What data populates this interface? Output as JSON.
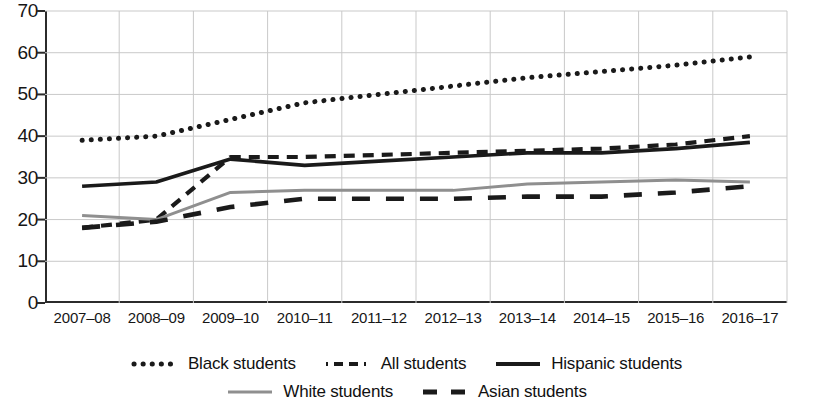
{
  "chart_data": {
    "type": "line",
    "title": "",
    "subtitle": "",
    "xlabel": "",
    "ylabel": "",
    "ylim": [
      0,
      70
    ],
    "yticks": [
      0,
      10,
      20,
      30,
      40,
      50,
      60,
      70
    ],
    "grid": true,
    "legend_position": "bottom",
    "categories": [
      "2007–08",
      "2008–09",
      "2009–10",
      "2010–11",
      "2011–12",
      "2012–13",
      "2013–14",
      "2014–15",
      "2015–16",
      "2016–17"
    ],
    "series": [
      {
        "name": "Black students",
        "style": "dotted",
        "color": "#1a1a1a",
        "values": [
          39,
          40,
          44,
          48,
          50,
          52,
          54,
          55.5,
          57,
          59
        ]
      },
      {
        "name": "All students",
        "style": "dashed",
        "color": "#1a1a1a",
        "values": [
          18,
          20,
          35,
          35,
          35.5,
          36,
          36.5,
          37,
          38,
          40
        ]
      },
      {
        "name": "Hispanic students",
        "style": "solid",
        "color": "#1a1a1a",
        "values": [
          28,
          29,
          34.5,
          33,
          34,
          35,
          36,
          36,
          37,
          38.5
        ]
      },
      {
        "name": "White students",
        "style": "solid-gray",
        "color": "#8f8f8f",
        "values": [
          21,
          20,
          26.5,
          27,
          27,
          27,
          28.5,
          29,
          29.5,
          29
        ]
      },
      {
        "name": "Asian students",
        "style": "long-dashed",
        "color": "#1a1a1a",
        "values": [
          18,
          19.5,
          23,
          25,
          25,
          25,
          25.5,
          25.5,
          26.5,
          28
        ]
      }
    ]
  },
  "legend": {
    "rows": [
      [
        {
          "label": "Black students",
          "swatch": "dotted-swatch-icon"
        },
        {
          "label": "All students",
          "swatch": "dashed-swatch-icon"
        },
        {
          "label": "Hispanic students",
          "swatch": "solid-swatch-icon"
        }
      ],
      [
        {
          "label": "White students",
          "swatch": "gray-solid-swatch-icon"
        },
        {
          "label": "Asian students",
          "swatch": "long-dashed-swatch-icon"
        }
      ]
    ]
  }
}
